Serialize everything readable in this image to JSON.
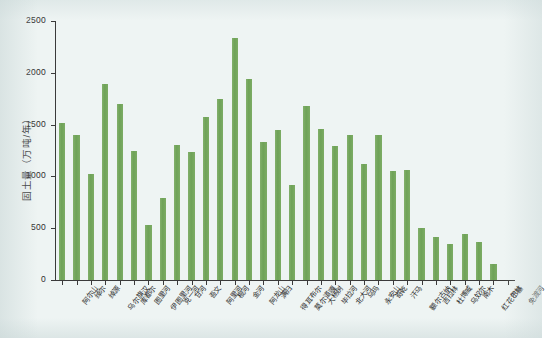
{
  "chart_data": {
    "type": "bar",
    "title": "",
    "xlabel": "",
    "ylabel": "固土量（万吨/年）",
    "ylim": [
      0,
      2500
    ],
    "ytick_labels": [
      "0",
      "500",
      "1000",
      "1500",
      "2000",
      "2500"
    ],
    "ytick_values": [
      0,
      500,
      1000,
      1500,
      2000,
      2500
    ],
    "grid": false,
    "legend": null,
    "bar_color": "#74a95c",
    "background_color": "#eef4f3",
    "axis_color": "#3a3a3a",
    "categories": [
      "阿尔山",
      "绰尔",
      "绰源",
      "乌尔旗汉",
      "库都尔",
      "图里河",
      "伊图里河",
      "克一河",
      "甘河",
      "吾文",
      "阿里河",
      "根河",
      "金河",
      "阿龙山",
      "满归",
      "得耳布尔",
      "莫尔道嘎",
      "大杨树",
      "毕拉河",
      "北大河",
      "乌玛",
      "永安山",
      "奇乾",
      "汗马",
      "额尔古纳",
      "吉拉林",
      "杜博威",
      "乌奴尔",
      "南木",
      "红花尔基",
      "巴林",
      "免渡河"
    ],
    "values": [
      1520,
      1400,
      1020,
      1890,
      1700,
      1250,
      530,
      790,
      1300,
      1240,
      1570,
      1750,
      2340,
      1940,
      1330,
      1450,
      920,
      1680,
      1460,
      1290,
      1400,
      1120,
      1400,
      1050,
      1060,
      500,
      420,
      350,
      440,
      370,
      150,
      0
    ]
  }
}
